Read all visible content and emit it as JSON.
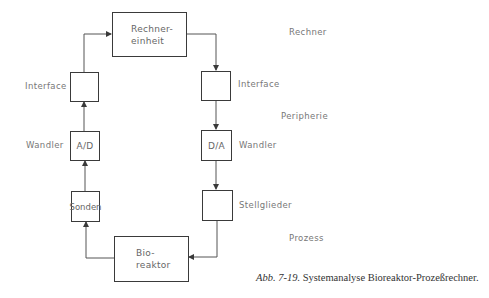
{
  "diagram": {
    "blocks": {
      "computer_unit": {
        "line1": "Rechner-",
        "line2": "einheit"
      },
      "interface_left": "",
      "interface_right": "",
      "ad_converter": "A/D",
      "da_converter": "D/A",
      "probes": "Sonden",
      "actuators": "",
      "bioreactor": {
        "line1": "Bio-",
        "line2": "reaktor"
      }
    },
    "side_labels": {
      "interface_left": "Interface",
      "interface_right": "Interface",
      "converter_left": "Wandler",
      "converter_right": "Wandler",
      "actuators": "Stellglieder"
    },
    "levels": {
      "computer": "Rechner",
      "periphery": "Peripherie",
      "process": "Prozess"
    },
    "caption": {
      "prefix": "Abb. 7-19.",
      "text": " Systemanalyse Bioreaktor-Prozeßrechner."
    },
    "colors": {
      "line": "#3a3a3a",
      "text": "#777777"
    }
  }
}
